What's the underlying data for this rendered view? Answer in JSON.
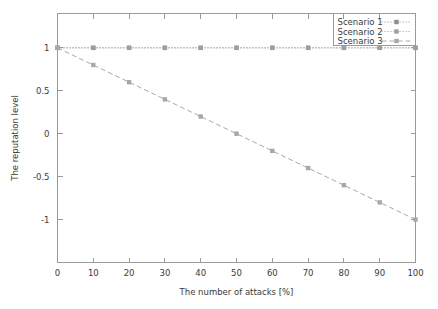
{
  "chart_data": {
    "type": "line",
    "title": "",
    "xlabel": "The number of attacks [%]",
    "ylabel": "The reputation level",
    "x": [
      0,
      10,
      20,
      30,
      40,
      50,
      60,
      70,
      80,
      90,
      100
    ],
    "xlim": [
      0,
      100
    ],
    "ylim": [
      -1.5,
      1.4
    ],
    "xticks": [
      "0",
      "10",
      "20",
      "30",
      "40",
      "50",
      "60",
      "70",
      "80",
      "90",
      "100"
    ],
    "xtick_values": [
      0,
      10,
      20,
      30,
      40,
      50,
      60,
      70,
      80,
      90,
      100
    ],
    "yticks": [
      "1",
      "0.5",
      "0",
      "-0.5",
      "-1"
    ],
    "ytick_values": [
      1,
      0.5,
      0,
      -0.5,
      -1
    ],
    "grid": false,
    "legend_position": "top-right",
    "series": [
      {
        "name": "Scenario 1",
        "values": [
          1,
          1,
          1,
          1,
          1,
          1,
          1,
          1,
          1,
          1,
          1
        ],
        "color": "#8c8c8c",
        "dash": "1,2",
        "marker": "square"
      },
      {
        "name": "Scenario 2",
        "values": [
          1,
          1,
          1,
          1,
          1,
          1,
          1,
          1,
          1,
          1,
          1
        ],
        "color": "#9e9e9e",
        "dash": "1,2",
        "marker": "square"
      },
      {
        "name": "Scenario 3",
        "values": [
          1,
          0.8,
          0.6,
          0.4,
          0.2,
          0,
          -0.2,
          -0.4,
          -0.6,
          -0.8,
          -1
        ],
        "color": "#a8a8a8",
        "dash": "5,3",
        "marker": "square"
      }
    ]
  },
  "legend": {
    "entries": [
      {
        "label": "Scenario 1"
      },
      {
        "label": "Scenario 2"
      },
      {
        "label": "Scenario 3"
      }
    ]
  },
  "axes": {
    "x_title": "The number of attacks [%]",
    "y_title": "The reputation level"
  }
}
